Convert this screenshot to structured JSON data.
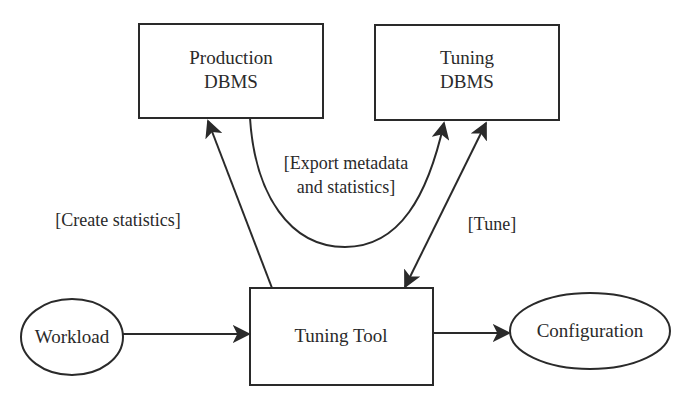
{
  "diagram": {
    "type": "flow",
    "nodes": [
      {
        "id": "production",
        "shape": "rect",
        "label_lines": [
          "Production",
          "DBMS"
        ]
      },
      {
        "id": "tuning_dbms",
        "shape": "rect",
        "label_lines": [
          "Tuning",
          "DBMS"
        ]
      },
      {
        "id": "tuning_tool",
        "shape": "rect",
        "label": "Tuning Tool"
      },
      {
        "id": "workload",
        "shape": "ellipse",
        "label": "Workload"
      },
      {
        "id": "configuration",
        "shape": "ellipse",
        "label": "Configuration"
      }
    ],
    "edges": [
      {
        "from": "tuning_tool",
        "to": "production",
        "label": "[Create statistics]"
      },
      {
        "from": "production",
        "to": "tuning_dbms",
        "label_lines": [
          "[Export metadata",
          "and statistics]"
        ]
      },
      {
        "from": "tuning_tool",
        "to": "tuning_dbms",
        "bidirectional": true,
        "label": "[Tune]"
      },
      {
        "from": "workload",
        "to": "tuning_tool"
      },
      {
        "from": "tuning_tool",
        "to": "configuration"
      }
    ]
  },
  "colors": {
    "stroke": "#2a2a2a",
    "background": "#ffffff"
  }
}
